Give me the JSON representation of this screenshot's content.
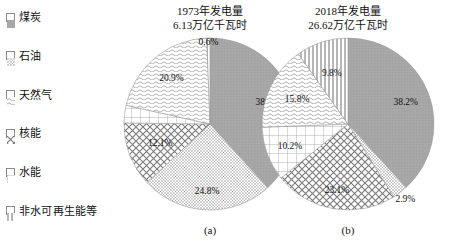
{
  "legend": {
    "items": [
      {
        "label": "煤炭",
        "pattern": "dots-dense",
        "icon": "legend-swatch-coal"
      },
      {
        "label": "石油",
        "pattern": "dots-fine",
        "icon": "legend-swatch-oil"
      },
      {
        "label": "天然气",
        "pattern": "wavy",
        "icon": "legend-swatch-gas"
      },
      {
        "label": "核能",
        "pattern": "crosshatch",
        "icon": "legend-swatch-nuclear"
      },
      {
        "label": "水能",
        "pattern": "grid",
        "icon": "legend-swatch-hydro"
      },
      {
        "label": "非水可再生能等",
        "pattern": "vertical-lines",
        "icon": "legend-swatch-renewables"
      }
    ]
  },
  "panels": [
    {
      "id": "a",
      "caption": "(a)",
      "title_line1": "1973年发电量",
      "title_line2": "6.13万亿千瓦时"
    },
    {
      "id": "b",
      "caption": "(b)",
      "title_line1": "2018年发电量",
      "title_line2": "26.62万亿千瓦时"
    }
  ],
  "chart_data": [
    {
      "type": "pie",
      "title": "1973年发电量 6.13万亿千瓦时",
      "subtitle": "(a)",
      "total_label": "6.13万亿千瓦时",
      "year": "1973",
      "start_angle": 0,
      "direction": "clockwise",
      "legend_position": "left",
      "categories": [
        "煤炭",
        "石油",
        "核能",
        "水能",
        "天然气",
        "非水可再生能等"
      ],
      "values": [
        38.3,
        24.8,
        12.1,
        3.3,
        20.9,
        0.6
      ],
      "labels": [
        "38.3%",
        "24.8%",
        "12.1%",
        "3.3%",
        "20.9%",
        "0.6%"
      ],
      "patterns": [
        "dots-dense",
        "dots-fine",
        "crosshatch",
        "grid",
        "wavy",
        "vertical-lines"
      ]
    },
    {
      "type": "pie",
      "title": "2018年发电量 26.62万亿千瓦时",
      "subtitle": "(b)",
      "total_label": "26.62万亿千瓦时",
      "year": "2018",
      "start_angle": 0,
      "direction": "clockwise",
      "legend_position": "left",
      "categories": [
        "煤炭",
        "石油",
        "核能",
        "水能",
        "天然气",
        "非水可再生能等"
      ],
      "values": [
        38.2,
        2.9,
        23.1,
        10.2,
        15.8,
        9.8
      ],
      "labels": [
        "38.2%",
        "2.9%",
        "23.1%",
        "10.2%",
        "15.8%",
        "9.8%"
      ],
      "patterns": [
        "dots-dense",
        "dots-fine",
        "crosshatch",
        "grid",
        "wavy",
        "vertical-lines"
      ]
    }
  ]
}
